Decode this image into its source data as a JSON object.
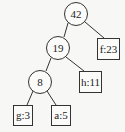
{
  "diagram": {
    "type": "huffman-tree",
    "nodes": [
      {
        "id": "n42",
        "label": "42",
        "shape": "circle"
      },
      {
        "id": "n19",
        "label": "19",
        "shape": "circle"
      },
      {
        "id": "f23",
        "label": "f:23",
        "shape": "box"
      },
      {
        "id": "n8",
        "label": "8",
        "shape": "circle"
      },
      {
        "id": "h11",
        "label": "h:11",
        "shape": "box"
      },
      {
        "id": "g3",
        "label": "g:3",
        "shape": "box"
      },
      {
        "id": "a5",
        "label": "a:5",
        "shape": "box"
      }
    ],
    "edges": [
      {
        "from": "42",
        "to": "19"
      },
      {
        "from": "42",
        "to": "f:23"
      },
      {
        "from": "19",
        "to": "8"
      },
      {
        "from": "19",
        "to": "h:11"
      },
      {
        "from": "8",
        "to": "g:3"
      },
      {
        "from": "8",
        "to": "a:5"
      }
    ],
    "labels": {
      "root": "42",
      "n19": "19",
      "f23": "f:23",
      "n8": "8",
      "h11": "h:11",
      "g3": "g:3",
      "a5": "a:5"
    },
    "colors": {
      "background": "#f7f7f5",
      "stroke": "#333333",
      "text": "#222222"
    }
  }
}
